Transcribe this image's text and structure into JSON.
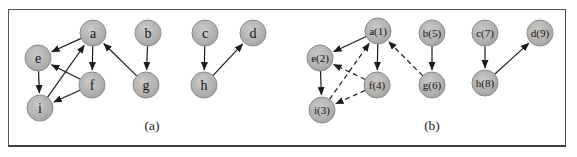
{
  "figure": {
    "node_radius": 13,
    "colors": {
      "node_fill": "#b2b1af",
      "node_fill_highlight": "#c9c8c6",
      "node_stroke": "#8b8a87",
      "edge": "#1b1b1b",
      "frame_border": "#56565a",
      "text": "#141414",
      "background": "#ffffff"
    },
    "panels": [
      {
        "id": "a",
        "label": "(a)",
        "label_x": 143,
        "nodes": [
          {
            "id": "a",
            "label": "a",
            "x": 84,
            "y": 23
          },
          {
            "id": "e",
            "label": "e",
            "x": 29,
            "y": 48
          },
          {
            "id": "f",
            "label": "f",
            "x": 83,
            "y": 75
          },
          {
            "id": "i",
            "label": "i",
            "x": 31,
            "y": 98
          },
          {
            "id": "b",
            "label": "b",
            "x": 139,
            "y": 23
          },
          {
            "id": "g",
            "label": "g",
            "x": 137,
            "y": 75
          },
          {
            "id": "c",
            "label": "c",
            "x": 196,
            "y": 23
          },
          {
            "id": "h",
            "label": "h",
            "x": 195,
            "y": 75
          },
          {
            "id": "d",
            "label": "d",
            "x": 244,
            "y": 23
          }
        ],
        "edges": [
          {
            "from": "a",
            "to": "e",
            "style": "solid"
          },
          {
            "from": "a",
            "to": "f",
            "style": "solid"
          },
          {
            "from": "f",
            "to": "e",
            "style": "solid"
          },
          {
            "from": "e",
            "to": "i",
            "style": "solid"
          },
          {
            "from": "f",
            "to": "i",
            "style": "solid"
          },
          {
            "from": "i",
            "to": "a",
            "style": "solid"
          },
          {
            "from": "g",
            "to": "a",
            "style": "solid"
          },
          {
            "from": "b",
            "to": "g",
            "style": "solid"
          },
          {
            "from": "c",
            "to": "h",
            "style": "solid"
          },
          {
            "from": "h",
            "to": "d",
            "style": "solid"
          }
        ]
      },
      {
        "id": "b",
        "label": "(b)",
        "label_x": 423,
        "nodes": [
          {
            "id": "a",
            "label": "a(1)",
            "x": 369,
            "y": 21
          },
          {
            "id": "e",
            "label": "e(2)",
            "x": 311,
            "y": 48
          },
          {
            "id": "f",
            "label": "f(4)",
            "x": 368,
            "y": 75
          },
          {
            "id": "i",
            "label": "i(3)",
            "x": 313,
            "y": 100
          },
          {
            "id": "b",
            "label": "b(5)",
            "x": 423,
            "y": 23
          },
          {
            "id": "g",
            "label": "g(6)",
            "x": 423,
            "y": 75
          },
          {
            "id": "c",
            "label": "c(7)",
            "x": 476,
            "y": 23
          },
          {
            "id": "h",
            "label": "h(8)",
            "x": 476,
            "y": 73
          },
          {
            "id": "d",
            "label": "d(9)",
            "x": 531,
            "y": 23
          }
        ],
        "edges": [
          {
            "from": "a",
            "to": "e",
            "style": "solid"
          },
          {
            "from": "a",
            "to": "f",
            "style": "solid"
          },
          {
            "from": "e",
            "to": "i",
            "style": "solid"
          },
          {
            "from": "b",
            "to": "g",
            "style": "solid"
          },
          {
            "from": "c",
            "to": "h",
            "style": "solid"
          },
          {
            "from": "h",
            "to": "d",
            "style": "solid"
          },
          {
            "from": "f",
            "to": "e",
            "style": "dashed"
          },
          {
            "from": "f",
            "to": "i",
            "style": "dashed"
          },
          {
            "from": "i",
            "to": "a",
            "style": "dashed"
          },
          {
            "from": "g",
            "to": "a",
            "style": "dashed"
          }
        ]
      }
    ]
  }
}
